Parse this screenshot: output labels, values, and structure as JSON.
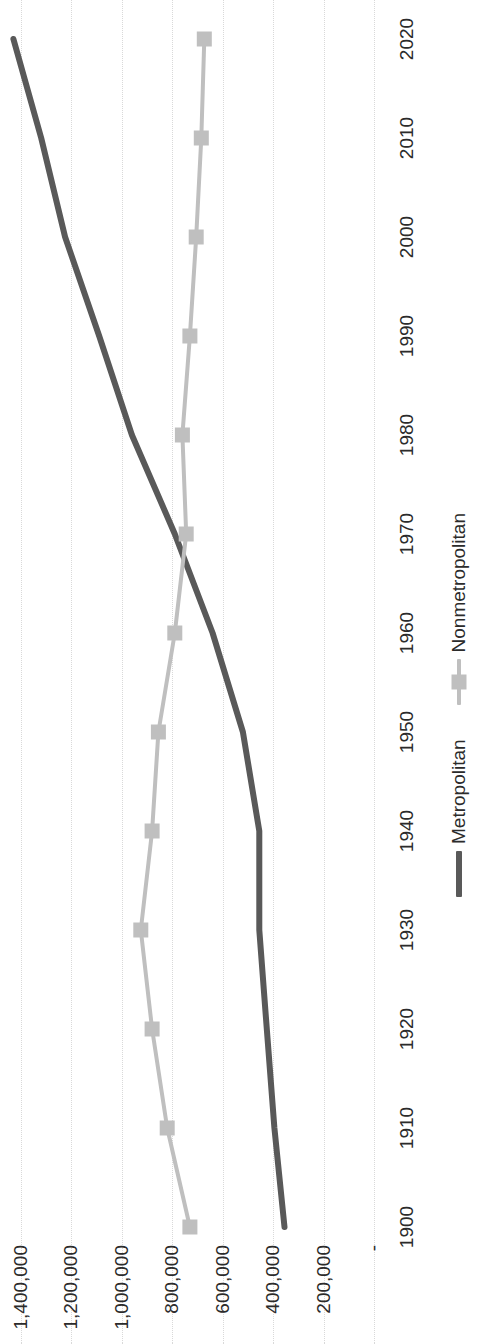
{
  "chart_data": {
    "type": "line",
    "title": "",
    "xlabel": "",
    "ylabel": "",
    "x": [
      1900,
      1910,
      1920,
      1930,
      1940,
      1950,
      1960,
      1970,
      1980,
      1990,
      2000,
      2010,
      2020
    ],
    "xtick_labels": [
      "1900",
      "1910",
      "1920",
      "1930",
      "1940",
      "1950",
      "1960",
      "1970",
      "1980",
      "1990",
      "2000",
      "2010",
      "2020"
    ],
    "ytick_labels": [
      "-",
      "200,000",
      "400,000",
      "600,000",
      "800,000",
      "1,000,000",
      "1,200,000",
      "1,400,000"
    ],
    "ytick_values": [
      0,
      200000,
      400000,
      600000,
      800000,
      1000000,
      1200000,
      1400000
    ],
    "ylim": [
      0,
      1400000
    ],
    "xlim": [
      1900,
      2020
    ],
    "grid": "horizontal-dotted",
    "legend_position": "bottom",
    "series": [
      {
        "name": "Metropolitan",
        "color": "#595959",
        "marker": "none",
        "linewidth": 6,
        "values": [
          355000,
          395000,
          425000,
          455000,
          455000,
          520000,
          640000,
          790000,
          960000,
          1090000,
          1225000,
          1320000,
          1430000
        ]
      },
      {
        "name": "Nonmetropolitan",
        "color": "#bfbfbf",
        "marker": "square",
        "linewidth": 4,
        "values": [
          730000,
          820000,
          880000,
          925000,
          880000,
          855000,
          790000,
          745000,
          760000,
          730000,
          705000,
          685000,
          673000
        ]
      }
    ]
  },
  "legend": {
    "items": [
      {
        "label": "Metropolitan",
        "color": "#595959",
        "marker": "none"
      },
      {
        "label": "Nonmetropolitan",
        "color": "#bfbfbf",
        "marker": "square"
      }
    ]
  },
  "axes": {
    "y_labels": [
      "1,400,000",
      "1,200,000",
      "1,000,000",
      "800,000",
      "600,000",
      "400,000",
      "200,000",
      "-"
    ],
    "x_labels": [
      "1900",
      "1910",
      "1920",
      "1930",
      "1940",
      "1950",
      "1960",
      "1970",
      "1980",
      "1990",
      "2000",
      "2010",
      "2020"
    ]
  }
}
